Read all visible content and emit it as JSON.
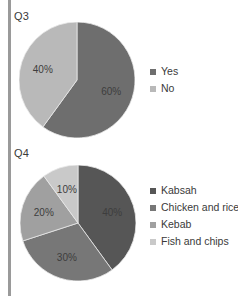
{
  "page": {
    "background": "#ffffff",
    "rule_color": "#9a9a9a"
  },
  "charts": [
    {
      "id": "q3",
      "label": "Q3",
      "label_x": 14,
      "label_y": 10,
      "center_x": 77,
      "center_y": 80,
      "radius": 58,
      "legend_x": 150,
      "legend_y": 66,
      "chart_data": {
        "type": "pie",
        "title": "Q3",
        "categories": [
          "Yes",
          "No"
        ],
        "values": [
          60,
          40
        ],
        "value_labels": [
          "60%",
          "40%"
        ],
        "colors": [
          "#6e6e6e",
          "#b9b9b9"
        ],
        "start_angle_deg": 0,
        "legend_position": "right",
        "grid": false
      }
    },
    {
      "id": "q4",
      "label": "Q4",
      "label_x": 14,
      "label_y": 147,
      "center_x": 78,
      "center_y": 223,
      "radius": 58,
      "legend_x": 150,
      "legend_y": 185,
      "chart_data": {
        "type": "pie",
        "title": "Q4",
        "categories": [
          "Kabsah",
          "Chicken and rice",
          "Kebab",
          "Fish and chips"
        ],
        "values": [
          40,
          30,
          20,
          10
        ],
        "value_labels": [
          "40%",
          "30%",
          "20%",
          "10%"
        ],
        "colors": [
          "#565656",
          "#777777",
          "#a0a0a0",
          "#c9c9c9"
        ],
        "start_angle_deg": 0,
        "legend_position": "right",
        "grid": false
      }
    }
  ]
}
